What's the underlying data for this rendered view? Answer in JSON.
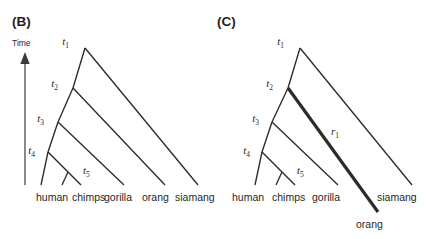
{
  "figure": {
    "background_color": "#ffffff",
    "line_color": "#2b2b2b",
    "panels": [
      {
        "id": "panel-b",
        "label": "(B)",
        "axis": {
          "label": "Time",
          "direction": "up"
        },
        "node_labels": [
          {
            "name": "t1",
            "base": "t",
            "sub": "1"
          },
          {
            "name": "t2",
            "base": "t",
            "sub": "2"
          },
          {
            "name": "t3",
            "base": "t",
            "sub": "3"
          },
          {
            "name": "t4",
            "base": "t",
            "sub": "4"
          },
          {
            "name": "t5",
            "base": "t",
            "sub": "5"
          }
        ],
        "tip_labels": [
          "human",
          "chimps",
          "gorilla",
          "orang",
          "siamang"
        ]
      },
      {
        "id": "panel-c",
        "label": "(C)",
        "node_labels": [
          {
            "name": "t1",
            "base": "t",
            "sub": "1"
          },
          {
            "name": "t2",
            "base": "t",
            "sub": "2"
          },
          {
            "name": "t3",
            "base": "t",
            "sub": "3"
          },
          {
            "name": "t4",
            "base": "t",
            "sub": "4"
          },
          {
            "name": "t5",
            "base": "t",
            "sub": "5"
          }
        ],
        "rate_labels": [
          {
            "name": "r1",
            "base": "r",
            "sub": "1"
          }
        ],
        "tip_labels": [
          "human",
          "chimps",
          "gorilla",
          "siamang"
        ],
        "extended_tip_label": "orang"
      }
    ]
  }
}
